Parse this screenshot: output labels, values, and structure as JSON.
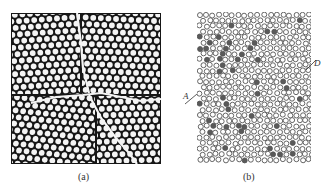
{
  "figure": {
    "panels": [
      {
        "id": "a",
        "label": "(a)",
        "description": "Hexagonally close-packed monolayer of spheres with polycrystalline domains separated by grain-boundary cracks",
        "colors": {
          "background": "#161616",
          "sphere": "#f4f4f4"
        }
      },
      {
        "id": "b",
        "label": "(b)",
        "description": "Disordered packing of hollow circles with scattered dark filled particles",
        "colors": {
          "outline": "#555555",
          "fill": "#ffffff",
          "dark_particle": "#5a5a5a"
        },
        "markers": [
          {
            "label": "A"
          },
          {
            "label": "D"
          }
        ]
      }
    ]
  }
}
